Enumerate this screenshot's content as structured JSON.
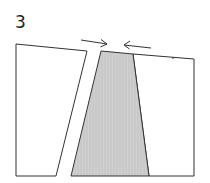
{
  "figure": {
    "label": "3",
    "colors": {
      "stroke": "#333333",
      "block_fill": "#ffffff",
      "wedge_fill": "#c8c8c8",
      "background": "#ffffff"
    },
    "elements": {
      "left_block": {
        "shape": "quadrilateral",
        "fill": "white"
      },
      "center_wedge": {
        "shape": "trapezoid",
        "fill": "gray"
      },
      "right_block": {
        "shape": "quadrilateral",
        "fill": "white"
      },
      "arrow_right": {
        "direction": "right",
        "meaning": "compression"
      },
      "arrow_left": {
        "direction": "left",
        "meaning": "compression"
      }
    }
  }
}
